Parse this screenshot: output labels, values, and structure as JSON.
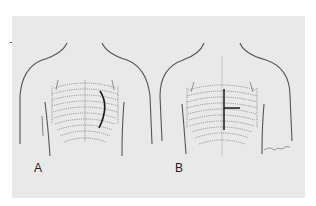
{
  "figure": {
    "background": "#e9e9e9",
    "line_color": "#555555",
    "incision_color": "#1a1a1a",
    "panels": [
      {
        "id": "A",
        "label": "A",
        "incision": "curved-lateral"
      },
      {
        "id": "B",
        "label": "B",
        "incision": "t-shaped-sternal",
        "signature": "signature-scribble"
      }
    ]
  }
}
